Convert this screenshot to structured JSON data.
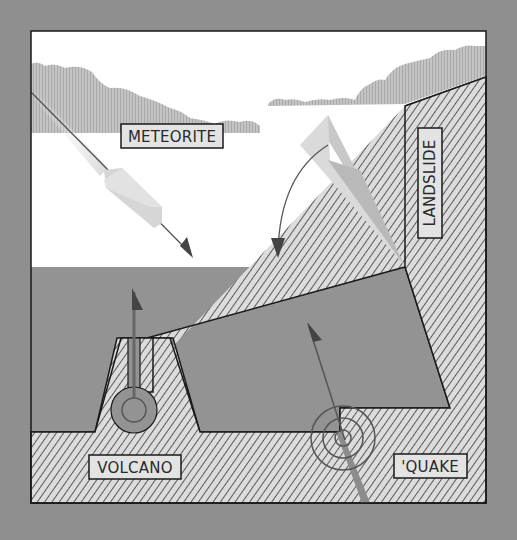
{
  "diagram": {
    "labels": {
      "meteorite": "METEORITE",
      "landslide": "LANDSLIDE",
      "volcano": "VOLCANO",
      "quake": "'QUAKE"
    },
    "colors": {
      "background": "#8f8f8f",
      "sky": "#ffffff",
      "water": "#939393",
      "hatch_fill": "#dcdcdc",
      "hatch_line": "#222222",
      "cloud": "#b9b9b9",
      "arrow": "#555555",
      "label_fill": "#e3e3e3",
      "frame": "#1a1a1a"
    },
    "elements": [
      {
        "name": "meteorite",
        "description": "falling meteorite with arrow into sea"
      },
      {
        "name": "landslide",
        "description": "slide of rock from cliff into sea with curved arrow"
      },
      {
        "name": "volcano",
        "description": "underwater volcano with vertical arrow"
      },
      {
        "name": "quake",
        "description": "seafloor fault with concentric waves and arrow"
      }
    ]
  }
}
